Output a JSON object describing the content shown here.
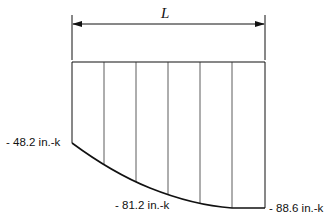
{
  "diagram": {
    "type": "bending-moment-diagram",
    "span_label": "L",
    "segments": 6,
    "labels": {
      "left_moment": "- 48.2 in.-k",
      "mid_moment": "- 81.2 in.-k",
      "right_moment": "- 88.6 in.-k"
    },
    "values": [
      {
        "position": "left end",
        "moment": -48.2,
        "unit": "in.-k"
      },
      {
        "position": "mid",
        "moment": -81.2,
        "unit": "in.-k"
      },
      {
        "position": "right end",
        "moment": -88.6,
        "unit": "in.-k"
      }
    ],
    "line_color": "#111111"
  }
}
